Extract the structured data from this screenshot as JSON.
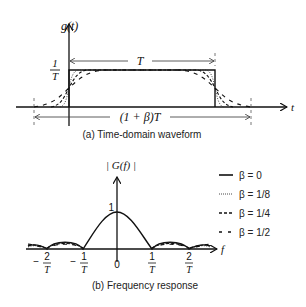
{
  "top_plot": {
    "y_axis_label": "g(t)",
    "x_axis_label": "t",
    "amplitude_label_num": "1",
    "amplitude_label_den": "T",
    "width_label": "T",
    "extended_width_label": "(1 + β)T",
    "caption": "(a) Time-domain waveform"
  },
  "bottom_plot": {
    "y_axis_label": "| G(f) |",
    "x_axis_label": "f",
    "peak_label": "1",
    "ticks": [
      {
        "sign": "−",
        "num": "2",
        "den": "T"
      },
      {
        "sign": "−",
        "num": "1",
        "den": "T"
      },
      {
        "sign": "",
        "num": "0",
        "den": ""
      },
      {
        "sign": "",
        "num": "1",
        "den": "T"
      },
      {
        "sign": "",
        "num": "2",
        "den": "T"
      }
    ],
    "caption": "(b) Frequency response"
  },
  "legend": [
    {
      "label": "β = 0",
      "style": "solid"
    },
    {
      "label": "β = 1/8",
      "style": "dotted"
    },
    {
      "label": "β = 1/4",
      "style": "dashed"
    },
    {
      "label": "β = 1/2",
      "style": "long-dashed"
    }
  ]
}
